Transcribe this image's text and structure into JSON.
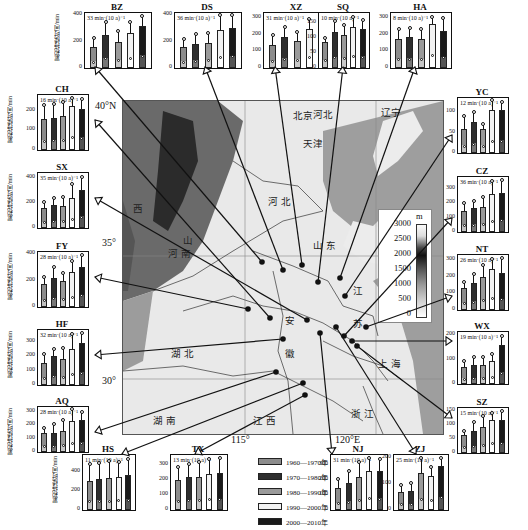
{
  "chart_data": {
    "type": "bar",
    "title": "",
    "ylabel": "累积持续时间/min",
    "categories": [
      "1960—1970年",
      "1970—1980年",
      "1980—1990年",
      "1990—2000年",
      "2000—2010年"
    ],
    "legend": [
      {
        "label": "1960—1970年",
        "color": "#8c8c8c"
      },
      {
        "label": "1970—1980年",
        "color": "#2e2e2e"
      },
      {
        "label": "1980—1990年",
        "color": "#9a9a9a"
      },
      {
        "label": "1990—2000年",
        "color": "#f2f2f2"
      },
      {
        "label": "2000—2010年",
        "color": "#1a1a1a"
      }
    ],
    "stations": [
      {
        "id": "BZ",
        "trend": "33 min·(10 a)⁻¹",
        "ymax": 400,
        "ticks": [
          200,
          400
        ],
        "values": [
          160,
          250,
          195,
          265,
          315
        ],
        "upper": [
          225,
          350,
          280,
          345,
          390
        ]
      },
      {
        "id": "DS",
        "trend": "36 min·(10 a)⁻¹",
        "ymax": 400,
        "ticks": [
          200,
          400
        ],
        "values": [
          160,
          185,
          190,
          285,
          300
        ],
        "upper": [
          220,
          255,
          265,
          400,
          415
        ]
      },
      {
        "id": "XZ",
        "trend": "31 min·(10 a)⁻¹",
        "ymax": 320,
        "ticks": [
          100,
          200,
          300
        ],
        "values": [
          140,
          185,
          165,
          235,
          270
        ],
        "upper": [
          200,
          245,
          215,
          295,
          320
        ]
      },
      {
        "id": "SQ",
        "trend": "10 min·(10 a)⁻¹",
        "ymax": 175,
        "ticks": [
          50,
          100,
          150
        ],
        "values": [
          85,
          120,
          110,
          135,
          128
        ],
        "upper": [
          100,
          155,
          142,
          170,
          158
        ]
      },
      {
        "id": "HA",
        "trend": "8 min·(10 a)⁻¹",
        "ymax": 320,
        "ticks": [
          100,
          200,
          300
        ],
        "values": [
          175,
          190,
          175,
          265,
          225
        ],
        "upper": [
          235,
          240,
          235,
          310,
          300
        ]
      },
      {
        "id": "CH",
        "trend": "16 min·(10 a)⁻¹",
        "ymax": 270,
        "ticks": [
          100,
          200
        ],
        "values": [
          160,
          165,
          175,
          225,
          210
        ],
        "upper": [
          230,
          235,
          245,
          265,
          260
        ]
      },
      {
        "id": "SX",
        "trend": "35 min·(10 a)⁻¹",
        "ymax": 420,
        "ticks": [
          200,
          400
        ],
        "values": [
          155,
          180,
          175,
          240,
          300
        ],
        "upper": [
          205,
          240,
          245,
          350,
          405
        ]
      },
      {
        "id": "FY",
        "trend": "28 min·(10 a)⁻¹",
        "ymax": 400,
        "ticks": [
          200,
          400
        ],
        "values": [
          175,
          220,
          200,
          265,
          300
        ],
        "upper": [
          225,
          300,
          260,
          345,
          395
        ]
      },
      {
        "id": "HF",
        "trend": "32 min·(10 a)⁻¹",
        "ymax": 370,
        "ticks": [
          100,
          200,
          300
        ],
        "values": [
          155,
          200,
          185,
          250,
          290
        ],
        "upper": [
          215,
          250,
          255,
          355,
          365
        ]
      },
      {
        "id": "AQ",
        "trend": "28 min·(10 a)⁻¹",
        "ymax": 320,
        "ticks": [
          100,
          200,
          300
        ],
        "values": [
          140,
          145,
          160,
          230,
          235
        ],
        "upper": [
          175,
          210,
          235,
          320,
          300
        ]
      },
      {
        "id": "YC",
        "trend": "12 min·(10 a)⁻¹",
        "ymax": 130,
        "ticks": [
          50,
          100
        ],
        "values": [
          60,
          75,
          60,
          105,
          105
        ],
        "upper": [
          90,
          100,
          70,
          130,
          125
        ]
      },
      {
        "id": "CZ",
        "trend": "36 min·(10 a)⁻¹",
        "ymax": 370,
        "ticks": [
          100,
          200,
          300
        ],
        "values": [
          150,
          170,
          175,
          265,
          275
        ],
        "upper": [
          200,
          220,
          245,
          355,
          365
        ]
      },
      {
        "id": "NT",
        "trend": "26 min·(10 a)⁻¹",
        "ymax": 320,
        "ticks": [
          100,
          200,
          300
        ],
        "values": [
          135,
          165,
          200,
          245,
          225
        ],
        "upper": [
          170,
          220,
          270,
          305,
          315
        ]
      },
      {
        "id": "WX",
        "trend": "19 min·(10 a)⁻¹",
        "ymax": 205,
        "ticks": [
          100,
          200
        ],
        "values": [
          70,
          80,
          80,
          95,
          160
        ],
        "upper": [
          95,
          110,
          110,
          125,
          195
        ]
      },
      {
        "id": "SZ",
        "trend": "15 min·(10 a)⁻¹",
        "ymax": 155,
        "ticks": [
          50,
          100,
          150
        ],
        "values": [
          65,
          80,
          95,
          120,
          118
        ],
        "upper": [
          80,
          110,
          132,
          145,
          150
        ]
      },
      {
        "id": "HS",
        "trend": "11 min·(10 a)⁻¹",
        "ymax": 560,
        "ticks": [
          200,
          400
        ],
        "values": [
          310,
          325,
          335,
          345,
          365
        ],
        "upper": [
          490,
          500,
          520,
          510,
          540
        ]
      },
      {
        "id": "TX",
        "trend": "13 min·(10 a)⁻¹",
        "ymax": 350,
        "ticks": [
          100,
          200,
          300
        ],
        "values": [
          195,
          215,
          220,
          240,
          245
        ],
        "upper": [
          285,
          305,
          315,
          335,
          345
        ]
      },
      {
        "id": "NJ",
        "trend": "31 min·(10 a)⁻¹",
        "ymax": 350,
        "ticks": [
          100,
          200,
          300
        ],
        "values": [
          145,
          180,
          220,
          260,
          255
        ],
        "upper": [
          205,
          255,
          315,
          345,
          340
        ]
      },
      {
        "id": "ZJ",
        "trend": "25 min·(10 a)⁻¹",
        "ymax": 205,
        "ticks": [
          100,
          200
        ],
        "values": [
          70,
          75,
          145,
          130,
          170
        ],
        "upper": [
          95,
          105,
          200,
          165,
          200
        ]
      }
    ]
  },
  "map": {
    "provinces": [
      {
        "name": "北京",
        "x": 170,
        "y": 107
      },
      {
        "name": "天津",
        "x": 180,
        "y": 135
      },
      {
        "name": "河北",
        "x": 190,
        "y": 106
      },
      {
        "name": "辽宁",
        "x": 258,
        "y": 104
      },
      {
        "name": "河 北",
        "x": 145,
        "y": 193
      },
      {
        "name": "山 东",
        "x": 190,
        "y": 237
      },
      {
        "name": "山",
        "x": 60,
        "y": 232
      },
      {
        "name": "西",
        "x": 10,
        "y": 200
      },
      {
        "name": "河 南",
        "x": 45,
        "y": 245
      },
      {
        "name": "江",
        "x": 230,
        "y": 282
      },
      {
        "name": "苏",
        "x": 230,
        "y": 315
      },
      {
        "name": "安",
        "x": 162,
        "y": 312
      },
      {
        "name": "徽",
        "x": 162,
        "y": 345
      },
      {
        "name": "湖 北",
        "x": 48,
        "y": 345
      },
      {
        "name": "上 海",
        "x": 255,
        "y": 355
      },
      {
        "name": "湖 南",
        "x": 30,
        "y": 412
      },
      {
        "name": "江 西",
        "x": 130,
        "y": 412
      },
      {
        "name": "浙 江",
        "x": 228,
        "y": 405
      }
    ],
    "coords": {
      "lat40": "40°N",
      "lat35": "35°",
      "lat30": "30°",
      "lon115": "115°",
      "lon120": "120°E"
    },
    "colorbar": {
      "unit": "m",
      "ticks": [
        "3000",
        "2500",
        "2000",
        "1500",
        "1000",
        "500",
        "0"
      ]
    }
  }
}
